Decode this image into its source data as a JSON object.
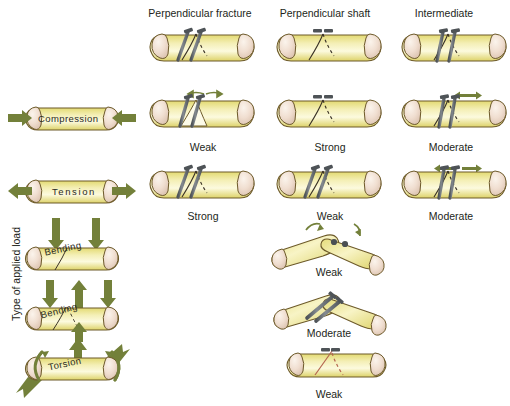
{
  "figure": {
    "axis_label": "Type of applied load",
    "watermark": "",
    "colors": {
      "bone_shaft": "#ece68f",
      "bone_shaft_light": "#f7f3c4",
      "bone_end": "#f0e2d2",
      "bone_outline": "#6d5a2a",
      "arrow": "#73803a",
      "screw": "#6e7277",
      "fracture_line": "#3a3226",
      "fracture_red": "#b4654f",
      "text": "#231f20"
    }
  },
  "columns": [
    {
      "id": "perpendicular-fracture",
      "label": "Perpendicular fracture"
    },
    {
      "id": "perpendicular-shaft",
      "label": "Perpendicular shaft"
    },
    {
      "id": "intermediate",
      "label": "Intermediate"
    }
  ],
  "rows": [
    {
      "id": "reference",
      "load": "",
      "results": [
        "",
        "",
        ""
      ]
    },
    {
      "id": "compression",
      "load": "Compression",
      "results": [
        "Weak",
        "Strong",
        "Moderate"
      ]
    },
    {
      "id": "tension",
      "load": "Tension",
      "results": [
        "Strong",
        "Weak",
        "Moderate"
      ]
    },
    {
      "id": "bending-1",
      "load": "Bending",
      "results": [
        "Weak"
      ]
    },
    {
      "id": "bending-2",
      "load": "Bending",
      "results": [
        "Moderate"
      ]
    },
    {
      "id": "torsion",
      "load": "Torsion",
      "results": [
        "Weak"
      ]
    }
  ],
  "captions": {
    "r1c1": "Weak",
    "r1c2": "Strong",
    "r1c3": "Moderate",
    "r2c1": "Strong",
    "r2c2": "Weak",
    "r2c3": "Moderate",
    "bend1": "Weak",
    "bend2": "Moderate",
    "torsion": "Weak"
  }
}
